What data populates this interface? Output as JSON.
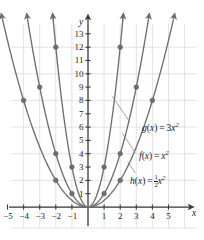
{
  "chart_data": {
    "type": "line",
    "title": "",
    "xlabel": "x",
    "ylabel": "y",
    "grid": true,
    "legend": "inline-annotations",
    "xlim": [
      -5.8,
      5.8
    ],
    "ylim": [
      -0.6,
      14.2
    ],
    "x_ticks": [
      -5,
      -4,
      -3,
      -2,
      -1,
      1,
      2,
      3,
      4,
      5
    ],
    "x_tick_labels": [
      "−5",
      "−4",
      "−3",
      "−2",
      "−1",
      "1",
      "2",
      "3",
      "4",
      "5"
    ],
    "y_ticks": [
      1,
      2,
      3,
      4,
      5,
      6,
      7,
      8,
      9,
      10,
      11,
      12,
      13
    ],
    "y_tick_labels": [
      "1",
      "2",
      "3",
      "4",
      "5",
      "6",
      "7",
      "8",
      "9",
      "10",
      "11",
      "12",
      "13"
    ],
    "curve_color": "#6e6e6e",
    "point_color": "#6e6e6e",
    "grid_color": "#d6d6d6",
    "axis_color": "#3a3a3a",
    "series": [
      {
        "name": "g",
        "label": "g(x) = 3x²",
        "formula_lead": "g",
        "formula_mid": "(x) = 3",
        "formula_var": "x",
        "formula_exp": "2",
        "coefficient": 3,
        "points": [
          {
            "x": -2,
            "y": 12
          },
          {
            "x": -1,
            "y": 3
          },
          {
            "x": 1,
            "y": 3
          },
          {
            "x": 2,
            "y": 12
          }
        ]
      },
      {
        "name": "f",
        "label": "f(x) = x²",
        "formula_lead": "f",
        "formula_mid": "(x) = ",
        "formula_var": "x",
        "formula_exp": "2",
        "coefficient": 1,
        "points": [
          {
            "x": -3,
            "y": 9
          },
          {
            "x": -2,
            "y": 4
          },
          {
            "x": -1,
            "y": 1
          },
          {
            "x": 1,
            "y": 1
          },
          {
            "x": 2,
            "y": 4
          },
          {
            "x": 3,
            "y": 9
          }
        ]
      },
      {
        "name": "h",
        "label": "h(x) = 1/2 x²",
        "formula_lead": "h",
        "formula_mid": "(x) = ",
        "formula_num": "1",
        "formula_den": "2",
        "formula_var": "x",
        "formula_exp": "2",
        "coefficient": 0.5,
        "points": [
          {
            "x": -4,
            "y": 8
          },
          {
            "x": -2,
            "y": 2
          },
          {
            "x": 2,
            "y": 2
          },
          {
            "x": 4,
            "y": 8
          }
        ]
      }
    ],
    "annotations": [
      {
        "for": "g",
        "leader_from": {
          "x": 1.48,
          "y": 8.35
        },
        "leader_to": {
          "x": 2.62,
          "y": 6.35
        }
      },
      {
        "for": "f",
        "leader_from": {
          "x": 2.12,
          "y": 5.55
        },
        "leader_to": {
          "x": 2.95,
          "y": 4.05
        }
      },
      {
        "for": "h",
        "leader_from": {
          "x": 2.48,
          "y": 3.35
        },
        "leader_to": {
          "x": 2.95,
          "y": 2.55
        }
      }
    ]
  },
  "axes": {
    "x_axis_name": "x",
    "y_axis_name": "y"
  }
}
